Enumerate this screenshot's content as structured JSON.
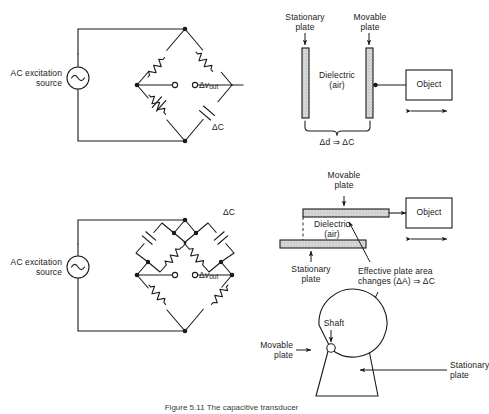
{
  "figure": {
    "caption": "Figure 5.11   The capacitive transducer",
    "line_color": "#1a1a1a",
    "plate_fill": "#d9d9d9",
    "background": "#ffffff"
  },
  "bridge_top": {
    "source_label": "AC excitation\nsource",
    "source_icon": "ac-source-icon",
    "output_label_delta": "Δ",
    "output_label_v": "v",
    "output_label_sub": "out",
    "delta_c_label": "ΔC",
    "arms": [
      {
        "position": "top-left",
        "type": "resistor"
      },
      {
        "position": "top-right",
        "type": "resistor"
      },
      {
        "position": "bottom-left",
        "type": "resistor"
      },
      {
        "position": "bottom-right",
        "type": "capacitor",
        "label": "ΔC"
      },
      {
        "position": "center-left-branch",
        "type": "capacitor"
      }
    ]
  },
  "bridge_bottom": {
    "source_label": "AC excitation\nsource",
    "source_icon": "ac-source-icon",
    "output_label_delta": "Δ",
    "output_label_v": "v",
    "output_label_sub": "out",
    "delta_c_label": "ΔC",
    "arms": [
      {
        "position": "top-left",
        "type": "parallel-rc"
      },
      {
        "position": "top-right",
        "type": "parallel-rc",
        "label": "ΔC"
      },
      {
        "position": "bottom-left",
        "type": "resistor"
      },
      {
        "position": "bottom-right",
        "type": "resistor"
      }
    ]
  },
  "transducer_gap": {
    "stationary_plate_label": "Stationary\nplate",
    "movable_plate_label": "Movable\nplate",
    "dielectric_label": "Dielectric\n(air)",
    "object_label": "Object",
    "relation_label": "Δd ⇒ ΔC",
    "motion_arrow": "double-arrow-horizontal"
  },
  "transducer_area": {
    "movable_plate_label": "Movable\nplate",
    "stationary_plate_label": "Stationary\nplate",
    "dielectric_label": "Dielectric\n(air)",
    "object_label": "Object",
    "relation_label": "Effective plate area\nchanges (ΔA) ⇒ ΔC",
    "motion_arrow": "double-arrow-horizontal"
  },
  "transducer_rotary": {
    "shaft_label": "Shaft",
    "movable_plate_label": "Movable\nplate",
    "stationary_plate_label": "Stationary\nplate"
  }
}
